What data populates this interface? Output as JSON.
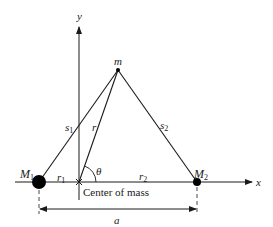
{
  "diagram": {
    "colors": {
      "ink": "#1a1a1a",
      "background": "#ffffff"
    },
    "axes": {
      "x_label": "x",
      "y_label": "y"
    },
    "bodies": {
      "M1": {
        "label": "M",
        "subscript": "1"
      },
      "M2": {
        "label": "M",
        "subscript": "2"
      },
      "m": {
        "label": "m"
      }
    },
    "segments": {
      "s1": {
        "label": "s",
        "subscript": "1"
      },
      "s2": {
        "label": "s",
        "subscript": "2"
      },
      "r": {
        "label": "r"
      },
      "r1": {
        "label": "r",
        "subscript": "1"
      },
      "r2": {
        "label": "r",
        "subscript": "2"
      }
    },
    "angle_label": "θ",
    "center_of_mass_label": "Center of mass",
    "separation_label": "a"
  }
}
